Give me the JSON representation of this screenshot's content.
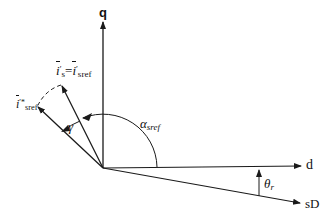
{
  "diagram": {
    "axes": {
      "q": {
        "label": "q"
      },
      "d": {
        "label": "d"
      },
      "sD": {
        "label": "sD"
      }
    },
    "vectors": {
      "is": {
        "label_main": "i",
        "label_prime": "′",
        "label_sub": "s",
        "equals": "=",
        "label2_main": "i",
        "label2_prime": "′",
        "label2_sub": "sref"
      },
      "isref_star": {
        "label_main": "i",
        "label_sup": "′*",
        "label_sub": "sref"
      }
    },
    "angles": {
      "alpha": {
        "symbol": "α",
        "sub": "sref"
      },
      "gamma": {
        "symbol": "γ"
      },
      "theta": {
        "symbol": "θ",
        "sub": "r"
      }
    },
    "colors": {
      "stroke": "#1a1a1a",
      "background": "#ffffff"
    }
  }
}
